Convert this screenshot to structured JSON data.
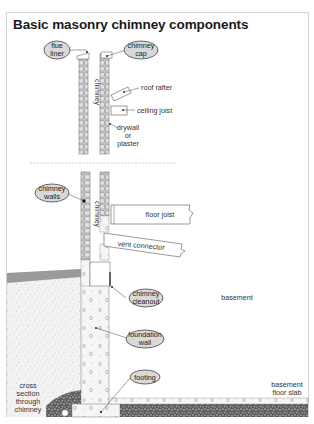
{
  "title": "Basic masonry chimney components",
  "callouts": {
    "flue_liner": [
      "flue",
      "liner"
    ],
    "chimney_cap": [
      "chimney",
      "cap"
    ],
    "chimney_walls": [
      "chimney",
      "walls"
    ],
    "chimney_cleanout": [
      "chimney",
      "cleanout"
    ],
    "foundation_wall": [
      "foundation",
      "wall"
    ],
    "footing": [
      "footing"
    ]
  },
  "labels": {
    "chimney_upper": "chimney",
    "chimney_lower": "chimney",
    "roof_rafter": "roof rafter",
    "ceiling_joist": "ceiling joist",
    "drywall": [
      "drywall",
      "or",
      "plaster"
    ],
    "floor_joist": "floor joist",
    "vent_connector": "vent connector",
    "basement": "basement",
    "cross_section": [
      "cross",
      "section",
      "through",
      "chimney"
    ],
    "basement_floor_slab": [
      "basement",
      "floor slab"
    ]
  },
  "colors": {
    "callout_fill": "#d9d9d9",
    "brick": "#c8c8c8",
    "soil": "#ededed",
    "grade": "#9a9a9a",
    "gravel": "#6e6e6e",
    "line": "#444444"
  }
}
